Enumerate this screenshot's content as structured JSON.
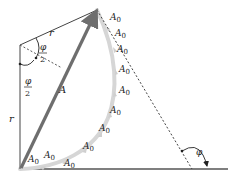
{
  "figure": {
    "colors": {
      "line": "#444444",
      "resultant": "#6e6e6e",
      "arc": "#d4d4d4",
      "background": "#ffffff"
    },
    "labels": {
      "radius_top": "r",
      "radius_left": "r",
      "resultant": "A",
      "half_angle_top_num": "φ",
      "half_angle_top_den": "2",
      "half_angle_bottom_num": "φ",
      "half_angle_bottom_den": "2",
      "angle": "φ",
      "phasor": "A",
      "phasor_sub": "0"
    },
    "phasor_labels": [
      {
        "x": 22,
        "y": 168
      },
      {
        "x": 42,
        "y": 163
      },
      {
        "x": 64,
        "y": 172
      },
      {
        "x": 84,
        "y": 153
      },
      {
        "x": 103,
        "y": 133
      },
      {
        "x": 114,
        "y": 113
      },
      {
        "x": 117,
        "y": 93
      },
      {
        "x": 117,
        "y": 71
      },
      {
        "x": 117,
        "y": 48
      },
      {
        "x": 113,
        "y": 28
      },
      {
        "x": 101,
        "y": 13
      }
    ]
  }
}
